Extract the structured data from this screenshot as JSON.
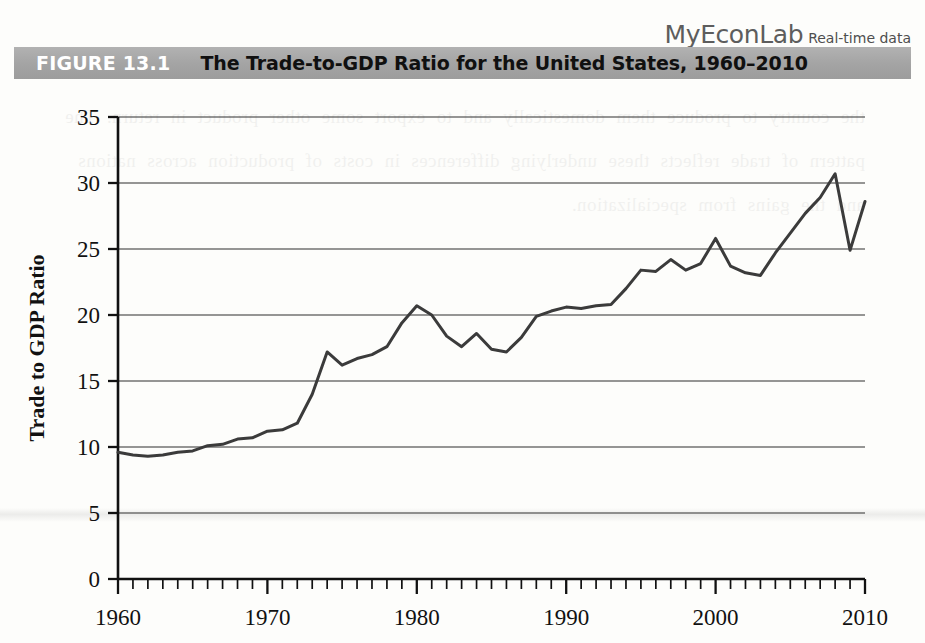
{
  "header": {
    "brand": "MyEconLab",
    "brand_suffix": "Real-time data",
    "figure_label": "FIGURE 13.1",
    "figure_title": "The Trade-to-GDP Ratio for the United States, 1960–2010",
    "banner_color": "#a5a5a5",
    "label_color": "#ffffff",
    "title_color": "#101010"
  },
  "page": {
    "bleed_text": "the country to produce them domestically and to export some other product in return. The pattern of trade reflects these underlying differences in costs of production across nations and the gains from specialization."
  },
  "chart_data": {
    "type": "line",
    "title": "The Trade-to-GDP Ratio for the United States, 1960–2010",
    "xlabel": "",
    "ylabel": "Trade to GDP Ratio",
    "xlim": [
      1960,
      2010
    ],
    "ylim": [
      0,
      35
    ],
    "ytick_step": 5,
    "yticks": [
      0,
      5,
      10,
      15,
      20,
      25,
      30,
      35
    ],
    "xticks_major": [
      1960,
      1970,
      1980,
      1990,
      2000,
      2010
    ],
    "xtick_minor_step": 1,
    "grid": "horizontal",
    "legend": "none",
    "line_color": "#3b3b3b",
    "series": [
      {
        "name": "Trade to GDP Ratio",
        "x": [
          1960,
          1961,
          1962,
          1963,
          1964,
          1965,
          1966,
          1967,
          1968,
          1969,
          1970,
          1971,
          1972,
          1973,
          1974,
          1975,
          1976,
          1977,
          1978,
          1979,
          1980,
          1981,
          1982,
          1983,
          1984,
          1985,
          1986,
          1987,
          1988,
          1989,
          1990,
          1991,
          1992,
          1993,
          1994,
          1995,
          1996,
          1997,
          1998,
          1999,
          2000,
          2001,
          2002,
          2003,
          2004,
          2005,
          2006,
          2007,
          2008,
          2009,
          2010
        ],
        "values": [
          9.6,
          9.4,
          9.3,
          9.4,
          9.6,
          9.7,
          10.1,
          10.2,
          10.6,
          10.7,
          11.2,
          11.3,
          11.8,
          14.0,
          17.2,
          16.2,
          16.7,
          17.0,
          17.6,
          19.4,
          20.7,
          20.0,
          18.4,
          17.6,
          18.6,
          17.4,
          17.2,
          18.3,
          19.9,
          20.3,
          20.6,
          20.5,
          20.7,
          20.8,
          22.0,
          23.4,
          23.3,
          24.2,
          23.4,
          23.9,
          25.8,
          23.7,
          23.2,
          23.0,
          24.7,
          26.2,
          27.7,
          28.9,
          30.7,
          24.9,
          28.6
        ]
      }
    ]
  }
}
